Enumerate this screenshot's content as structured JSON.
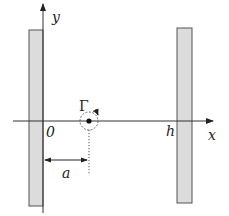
{
  "diagram": {
    "labels": {
      "y_axis": "y",
      "x_axis": "x",
      "origin": "0",
      "right_wall_position": "h",
      "vortex_strength": "Γ",
      "vortex_distance": "a"
    },
    "colors": {
      "wall_fill": "#dcdcdc",
      "wall_stroke": "#555555",
      "line": "#333333"
    },
    "elements": {
      "left_wall": "plane wall at x = 0",
      "right_wall": "plane wall at x = h",
      "vortex": "point vortex with circulation Γ at x = a"
    }
  }
}
